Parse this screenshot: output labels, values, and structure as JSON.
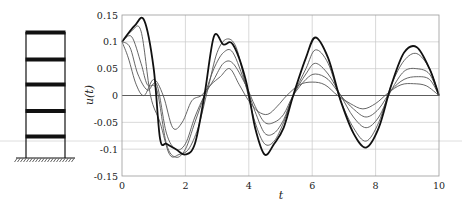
{
  "chart_data": {
    "type": "line",
    "title": "",
    "xlabel": "t",
    "ylabel": "u(t)",
    "xlim": [
      0,
      10
    ],
    "ylim": [
      -0.15,
      0.15
    ],
    "grid": true,
    "legend": "none",
    "xticks": [
      0,
      2,
      4,
      6,
      8,
      10
    ],
    "xtick_labels": [
      "0",
      "2",
      "4",
      "6",
      "8",
      "10"
    ],
    "yticks": [
      0.15,
      0.1,
      0.05,
      0,
      -0.05,
      -0.1,
      -0.15
    ],
    "ytick_labels": [
      "0.15",
      "0.1",
      "0.05",
      "0",
      "-0.05",
      "-0.1",
      "-0.15"
    ],
    "series": [
      {
        "name": "floor 5 (top)",
        "bold": true,
        "x": [
          0,
          0.4,
          0.7,
          1.0,
          1.2,
          1.4,
          1.7,
          2.0,
          2.3,
          2.6,
          2.9,
          3.2,
          3.5,
          3.9,
          4.2,
          4.5,
          4.8,
          5.1,
          5.4,
          5.8,
          6.1,
          6.5,
          6.9,
          7.3,
          7.7,
          8.1,
          8.5,
          8.9,
          9.3,
          9.7,
          10
        ],
        "y": [
          0.1,
          0.13,
          0.14,
          0.05,
          -0.08,
          -0.09,
          -0.1,
          -0.11,
          -0.09,
          0.0,
          0.11,
          0.095,
          0.095,
          0.03,
          -0.06,
          -0.11,
          -0.09,
          -0.06,
          0.0,
          0.07,
          0.108,
          0.07,
          -0.01,
          -0.07,
          -0.097,
          -0.06,
          0.02,
          0.08,
          0.09,
          0.05,
          0.0
        ]
      },
      {
        "name": "floor 4",
        "x": [
          0,
          0.3,
          0.6,
          0.9,
          1.2,
          1.5,
          1.8,
          2.1,
          2.4,
          2.7,
          3.0,
          3.3,
          3.6,
          3.9,
          4.2,
          4.5,
          4.8,
          5.1,
          5.4,
          5.8,
          6.1,
          6.5,
          6.9,
          7.3,
          7.7,
          8.1,
          8.5,
          8.9,
          9.3,
          9.7,
          10
        ],
        "y": [
          0.1,
          0.12,
          0.12,
          0.0,
          -0.05,
          -0.11,
          -0.11,
          -0.1,
          -0.06,
          0.01,
          0.08,
          0.105,
          0.09,
          0.02,
          -0.05,
          -0.09,
          -0.085,
          -0.05,
          0.0,
          0.05,
          0.085,
          0.06,
          -0.01,
          -0.06,
          -0.085,
          -0.05,
          0.02,
          0.065,
          0.078,
          0.05,
          0.0
        ]
      },
      {
        "name": "floor 3",
        "x": [
          0,
          0.3,
          0.6,
          0.8,
          1.1,
          1.4,
          1.7,
          2.0,
          2.3,
          2.6,
          2.9,
          3.2,
          3.5,
          3.9,
          4.2,
          4.5,
          4.8,
          5.1,
          5.4,
          5.8,
          6.1,
          6.5,
          6.9,
          7.3,
          7.7,
          8.1,
          8.5,
          8.9,
          9.3,
          9.7,
          10
        ],
        "y": [
          0.1,
          0.11,
          0.06,
          0.02,
          0.01,
          -0.09,
          -0.115,
          -0.1,
          -0.05,
          0.0,
          0.05,
          0.08,
          0.08,
          0.02,
          -0.03,
          -0.07,
          -0.07,
          -0.045,
          0.0,
          0.04,
          0.06,
          0.04,
          0.0,
          -0.04,
          -0.06,
          -0.04,
          0.01,
          0.045,
          0.05,
          0.04,
          0.0
        ]
      },
      {
        "name": "floor 2",
        "x": [
          0,
          0.25,
          0.5,
          0.8,
          1.1,
          1.4,
          1.7,
          2.0,
          2.3,
          2.6,
          2.9,
          3.2,
          3.5,
          3.9,
          4.2,
          4.5,
          4.8,
          5.1,
          5.4,
          5.8,
          6.1,
          6.5,
          6.9,
          7.3,
          7.7,
          8.1,
          8.5,
          8.9,
          9.3,
          9.7,
          10
        ],
        "y": [
          0.1,
          0.09,
          0.04,
          0.01,
          0.02,
          -0.07,
          -0.1,
          -0.09,
          -0.04,
          0.0,
          0.03,
          0.06,
          0.06,
          0.02,
          -0.02,
          -0.05,
          -0.05,
          -0.035,
          0.0,
          0.03,
          0.04,
          0.03,
          0.0,
          -0.025,
          -0.04,
          -0.025,
          0.01,
          0.03,
          0.035,
          0.03,
          0.0
        ]
      },
      {
        "name": "floor 1",
        "x": [
          0,
          0.2,
          0.45,
          0.7,
          1.0,
          1.3,
          1.6,
          1.9,
          2.2,
          2.5,
          2.8,
          3.1,
          3.4,
          3.7,
          4.0,
          4.3,
          4.6,
          4.9,
          5.2,
          5.6,
          6.0,
          6.4,
          6.8,
          7.2,
          7.6,
          8.0,
          8.4,
          8.8,
          9.2,
          9.6,
          10
        ],
        "y": [
          0.1,
          0.07,
          0.02,
          0.0,
          0.03,
          0.0,
          -0.06,
          -0.05,
          -0.01,
          0.0,
          0.02,
          0.035,
          0.05,
          0.02,
          -0.01,
          -0.03,
          -0.035,
          -0.02,
          0.0,
          0.02,
          0.025,
          0.02,
          0.0,
          -0.015,
          -0.025,
          -0.015,
          0.005,
          0.02,
          0.022,
          0.018,
          0.0
        ]
      }
    ]
  },
  "structure": {
    "description": "five-story shear frame on fixed base",
    "stories": 5
  }
}
